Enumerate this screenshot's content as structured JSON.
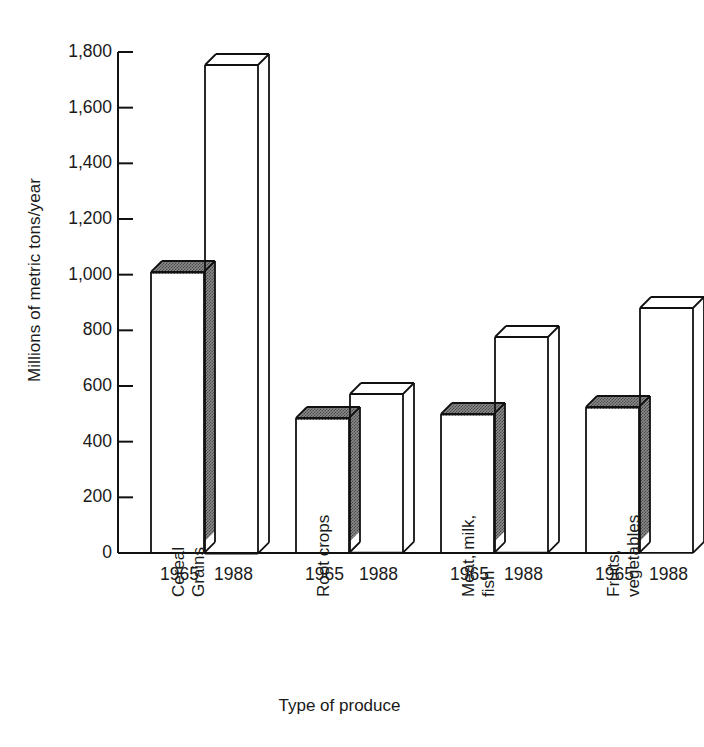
{
  "chart_data": {
    "type": "bar",
    "title": "",
    "xlabel": "Type of produce",
    "ylabel": "Millions of metric tons/year",
    "ylim": [
      0,
      1800
    ],
    "ytick_values": [
      0,
      200,
      400,
      600,
      800,
      1000,
      1200,
      1400,
      1600,
      1800
    ],
    "ytick_labels": [
      "0",
      "200",
      "400",
      "600",
      "800",
      "1,000",
      "1,200",
      "1,400",
      "1,600",
      "1,800"
    ],
    "grid": false,
    "legend": "none",
    "style": "3d-isometric-bars",
    "categories": [
      "Cereal Grains",
      "Root crops",
      "Meat, milk, fish",
      "Fruits, vegetables"
    ],
    "category_label_lines": [
      [
        "Cereal",
        "Grains"
      ],
      [
        "Root crops",
        ""
      ],
      [
        "Meat, milk,",
        "fish"
      ],
      [
        "Fruits,",
        "vegetables"
      ]
    ],
    "series": [
      {
        "name": "1965",
        "fill": "shaded",
        "values": [
          1010,
          485,
          500,
          525
        ]
      },
      {
        "name": "1988",
        "fill": "open",
        "values": [
          1755,
          570,
          775,
          880
        ]
      }
    ],
    "bar_labels": [
      "1965",
      "1988",
      "1965",
      "1988",
      "1965",
      "1988",
      "1965",
      "1988"
    ]
  },
  "axis": {
    "y_title": "Millions of metric tons/year",
    "x_title": "Type of produce"
  },
  "colors": {
    "axis": "#111111",
    "bar_outline": "#111111",
    "bar_shaded_fill": "#9c9c9c",
    "bar_open_fill": "#ffffff",
    "text": "#1a1a1a",
    "background": "#ffffff"
  }
}
